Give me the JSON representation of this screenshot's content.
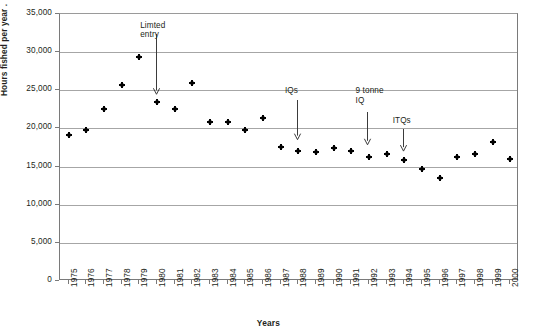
{
  "chart_data": {
    "type": "scatter",
    "title": "",
    "xlabel": "Years",
    "ylabel": "Hours fished per year .",
    "xlim": [
      1974.5,
      2000.5
    ],
    "ylim": [
      0,
      35000
    ],
    "grid": true,
    "legend": false,
    "y_ticks": [
      {
        "value": 0,
        "label": "0"
      },
      {
        "value": 5000,
        "label": "5,000"
      },
      {
        "value": 10000,
        "label": "10,000"
      },
      {
        "value": 15000,
        "label": "15,000"
      },
      {
        "value": 20000,
        "label": "20,000"
      },
      {
        "value": 25000,
        "label": "25,000"
      },
      {
        "value": 30000,
        "label": "30,000"
      },
      {
        "value": 35000,
        "label": "35,000"
      }
    ],
    "categories": [
      "1975",
      "1976",
      "1977",
      "1978",
      "1979",
      "1980",
      "1981",
      "1982",
      "1983",
      "1984",
      "1985",
      "1986",
      "1987",
      "1988",
      "1989",
      "1990",
      "1991",
      "1992",
      "1993",
      "1994",
      "1995",
      "1996",
      "1997",
      "1998",
      "1999",
      "2000"
    ],
    "values": [
      19100,
      19800,
      22600,
      25700,
      29300,
      23400,
      22600,
      26000,
      20900,
      20800,
      19800,
      21400,
      17600,
      17100,
      16900,
      17400,
      17000,
      16300,
      16700,
      15900,
      14700,
      13500,
      16200,
      16600,
      18200,
      16000
    ],
    "series": [
      {
        "name": "Hours fished per year",
        "marker": "diamond",
        "color": "#000000",
        "points": [
          {
            "x": "1975",
            "y": 19100
          },
          {
            "x": "1976",
            "y": 19800
          },
          {
            "x": "1977",
            "y": 22600
          },
          {
            "x": "1978",
            "y": 25700
          },
          {
            "x": "1979",
            "y": 29300
          },
          {
            "x": "1980",
            "y": 23400
          },
          {
            "x": "1981",
            "y": 22600
          },
          {
            "x": "1982",
            "y": 26000
          },
          {
            "x": "1983",
            "y": 20900
          },
          {
            "x": "1984",
            "y": 20800
          },
          {
            "x": "1985",
            "y": 19800
          },
          {
            "x": "1986",
            "y": 21400
          },
          {
            "x": "1987",
            "y": 17600
          },
          {
            "x": "1988",
            "y": 17100
          },
          {
            "x": "1989",
            "y": 16900
          },
          {
            "x": "1990",
            "y": 17400
          },
          {
            "x": "1991",
            "y": 17000
          },
          {
            "x": "1992",
            "y": 16300
          },
          {
            "x": "1993",
            "y": 16700
          },
          {
            "x": "1994",
            "y": 15900
          },
          {
            "x": "1995",
            "y": 14700
          },
          {
            "x": "1996",
            "y": 13500
          },
          {
            "x": "1997",
            "y": 16200
          },
          {
            "x": "1998",
            "y": 16600
          },
          {
            "x": "1999",
            "y": 18200
          },
          {
            "x": "2000",
            "y": 16000
          }
        ]
      }
    ],
    "annotations": [
      {
        "id": "limited-entry",
        "text": "Limted\nentry",
        "label_x": 1979.1,
        "label_y": 34000,
        "arrow_x": 1980.0,
        "arrow_from_y": 32200,
        "arrow_to_y": 24300
      },
      {
        "id": "iqs",
        "text": "IQs",
        "label_x": 1987.3,
        "label_y": 25400,
        "arrow_x": 1988.0,
        "arrow_from_y": 23600,
        "arrow_to_y": 18400
      },
      {
        "id": "nine-tonne-iq",
        "text": "9 tonne\nIQ",
        "label_x": 1991.3,
        "label_y": 25400,
        "arrow_x": 1992.0,
        "arrow_from_y": 22000,
        "arrow_to_y": 17700
      },
      {
        "id": "itqs",
        "text": "ITQs",
        "label_x": 1993.4,
        "label_y": 21500,
        "arrow_x": 1994.0,
        "arrow_from_y": 19800,
        "arrow_to_y": 16900
      }
    ],
    "colors": {
      "marker": "#000000",
      "gridline": "#a6a6a6",
      "axis": "#7a7a7a",
      "text": "#231f20",
      "background": "#ffffff"
    }
  }
}
